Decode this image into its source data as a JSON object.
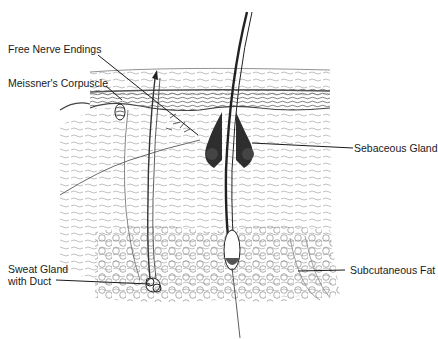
{
  "diagram": {
    "type": "anatomical-illustration",
    "labels": {
      "free_nerve_endings": "Free Nerve Endings",
      "meissners_corpuscle": "Meissner's Corpuscle",
      "sebaceous_gland": "Sebaceous Gland",
      "sweat_gland_line1": "Sweat Gland",
      "sweat_gland_line2": "with Duct",
      "subcutaneous_fat": "Subcutaneous Fat"
    },
    "colors": {
      "ink": "#1a1a1a",
      "epidermis_line": "#555555",
      "dermis_hatch": "#9a9a9a",
      "fat_cells": "#8a8a8a",
      "gland_fill": "#3a3a3a",
      "background": "#ffffff"
    }
  }
}
